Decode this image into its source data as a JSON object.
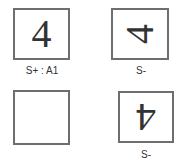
{
  "cells": [
    {
      "digit": "4",
      "orientation": "upright",
      "label": "S+ : A1"
    },
    {
      "digit": "4",
      "orientation": "rotated-90-ccw",
      "label": "S-"
    },
    {
      "digit": "",
      "orientation": "none",
      "label": ""
    },
    {
      "digit": "4",
      "orientation": "rotated-180",
      "label": "S-"
    }
  ],
  "colors": {
    "border": "#6e6e6e",
    "text": "#333333"
  }
}
